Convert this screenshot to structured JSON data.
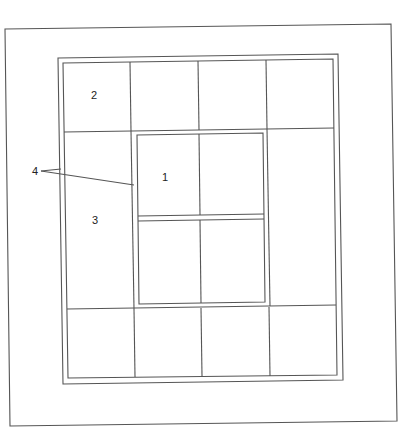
{
  "figure": {
    "type": "patent-line-drawing",
    "line_color": "#555555",
    "background": "#ffffff"
  },
  "labels": [
    {
      "id": "1",
      "text": "1",
      "x": 165,
      "y": 180
    },
    {
      "id": "2",
      "text": "2",
      "x": 94,
      "y": 98
    },
    {
      "id": "3",
      "text": "3",
      "x": 95,
      "y": 223
    },
    {
      "id": "4",
      "text": "4",
      "x": 35,
      "y": 174
    }
  ],
  "frames": {
    "outer": {
      "tl": [
        5,
        29
      ],
      "tr": [
        391,
        24
      ],
      "br": [
        397,
        421
      ],
      "bl": [
        10,
        426
      ]
    },
    "middle": {
      "tl": [
        58,
        58
      ],
      "tr": [
        338,
        54
      ],
      "br": [
        343,
        380
      ],
      "bl": [
        63,
        384
      ]
    },
    "inner": {
      "tl": [
        63,
        63
      ],
      "tr": [
        333,
        59
      ],
      "br": [
        337,
        375
      ],
      "bl": [
        68,
        378
      ]
    }
  },
  "center_window": {
    "outer": {
      "tl": [
        133,
        131
      ],
      "tr": [
        267,
        129
      ],
      "br": [
        270,
        306
      ],
      "bl": [
        135,
        308
      ]
    },
    "inner": {
      "tl": [
        137,
        135
      ],
      "tr": [
        263,
        133
      ],
      "br": [
        265,
        302
      ],
      "bl": [
        139,
        304
      ]
    },
    "rail_top_y": 215,
    "rail_bottom_y": 220,
    "mullion_x": 199
  },
  "leaders": [
    {
      "from": [
        41,
        171
      ],
      "to": [
        61,
        169
      ]
    },
    {
      "from": [
        41,
        171
      ],
      "to": [
        134,
        185
      ]
    }
  ]
}
